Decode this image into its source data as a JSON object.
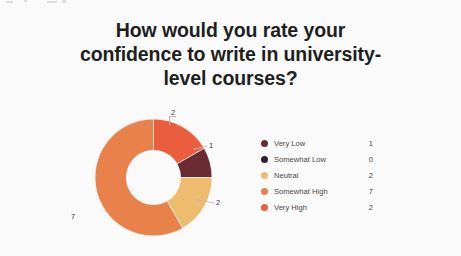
{
  "chart_data": {
    "type": "pie",
    "variant": "donut",
    "title": "How would you rate your\nconfidence to write in university-\nlevel courses?",
    "title_plain": "How would you rate your confidence to write in university-level courses?",
    "categories": [
      "Very Low",
      "Somewhat Low",
      "Neutral",
      "Somewhat High",
      "Very High"
    ],
    "values": [
      1,
      0,
      2,
      7,
      2
    ],
    "colors": [
      "#6b2b32",
      "#2e2030",
      "#edbc6e",
      "#e8824a",
      "#ea5d3d"
    ],
    "total": 12,
    "xlabel": "",
    "ylabel": "",
    "grid": false,
    "legend_position": "right",
    "data_labels": [
      {
        "name": "label-very-high",
        "text": "2"
      },
      {
        "name": "label-very-low",
        "text": "1"
      },
      {
        "name": "label-neutral",
        "text": "2"
      },
      {
        "name": "label-somewhat-high",
        "text": "7"
      }
    ],
    "legend": [
      {
        "label": "Very Low",
        "value": "1",
        "color": "#6b2b32"
      },
      {
        "label": "Somewhat Low",
        "value": "0",
        "color": "#2e2030"
      },
      {
        "label": "Neutral",
        "value": "2",
        "color": "#edbc6e"
      },
      {
        "label": "Somewhat High",
        "value": "7",
        "color": "#e8824a"
      },
      {
        "label": "Very High",
        "value": "2",
        "color": "#ea5d3d"
      }
    ]
  }
}
